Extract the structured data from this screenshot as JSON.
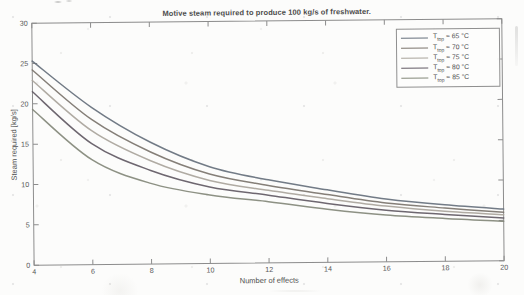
{
  "figure": {
    "title": "Motive steam required to produce 100 kg/s of freshwater.",
    "xlabel": "Number of effects",
    "ylabel": "Steam required [kg/s]"
  },
  "legend": {
    "position": "upper right",
    "items": [
      {
        "base": "T",
        "sub": "top",
        "rest": " = 65 °C",
        "label": "Ttop = 65 °C",
        "color": "#66707c"
      },
      {
        "base": "T",
        "sub": "top",
        "rest": " = 70 °C",
        "label": "Ttop = 70 °C",
        "color": "#7b746c"
      },
      {
        "base": "T",
        "sub": "top",
        "rest": " = 75 °C",
        "label": "Ttop = 75 °C",
        "color": "#a9a49b"
      },
      {
        "base": "T",
        "sub": "top",
        "rest": " = 80 °C",
        "label": "Ttop = 80 °C",
        "color": "#625a64"
      },
      {
        "base": "T",
        "sub": "top",
        "rest": " = 85 °C",
        "label": "Ttop = 85 °C",
        "color": "#838879"
      }
    ]
  },
  "chart_data": {
    "type": "line",
    "title": "Motive steam required to produce 100 kg/s of freshwater.",
    "xlabel": "Number of effects",
    "ylabel": "Steam required [kg/s]",
    "xlim": [
      4,
      20
    ],
    "ylim": [
      0,
      30
    ],
    "xticks": [
      4,
      6,
      8,
      10,
      12,
      14,
      16,
      18,
      20
    ],
    "yticks": [
      0,
      5,
      10,
      15,
      20,
      25,
      30
    ],
    "grid": false,
    "legend_position": "upper right",
    "x": [
      4,
      6,
      8,
      10,
      12,
      14,
      16,
      18,
      20
    ],
    "series": [
      {
        "name": "Ttop = 65 °C",
        "color": "#66707c",
        "values": [
          25.3,
          19.5,
          15.1,
          12.0,
          10.3,
          9.0,
          7.8,
          7.0,
          6.4
        ]
      },
      {
        "name": "Ttop = 70 °C",
        "color": "#7b746c",
        "values": [
          24.2,
          18.0,
          13.9,
          11.1,
          9.6,
          8.4,
          7.3,
          6.6,
          6.0
        ]
      },
      {
        "name": "Ttop = 75 °C",
        "color": "#a9a49b",
        "values": [
          22.9,
          16.6,
          12.8,
          10.3,
          9.0,
          7.9,
          6.9,
          6.2,
          5.7
        ]
      },
      {
        "name": "Ttop = 80 °C",
        "color": "#625a64",
        "values": [
          21.5,
          15.0,
          11.6,
          9.5,
          8.4,
          7.3,
          6.4,
          5.8,
          5.3
        ]
      },
      {
        "name": "Ttop = 85 °C",
        "color": "#838879",
        "values": [
          19.3,
          13.0,
          10.0,
          8.5,
          7.6,
          6.6,
          5.8,
          5.3,
          4.9
        ]
      }
    ]
  },
  "plot_geometry": {
    "left": 33,
    "right": 503,
    "top": 21,
    "bottom": 263,
    "tick_len": 5
  }
}
